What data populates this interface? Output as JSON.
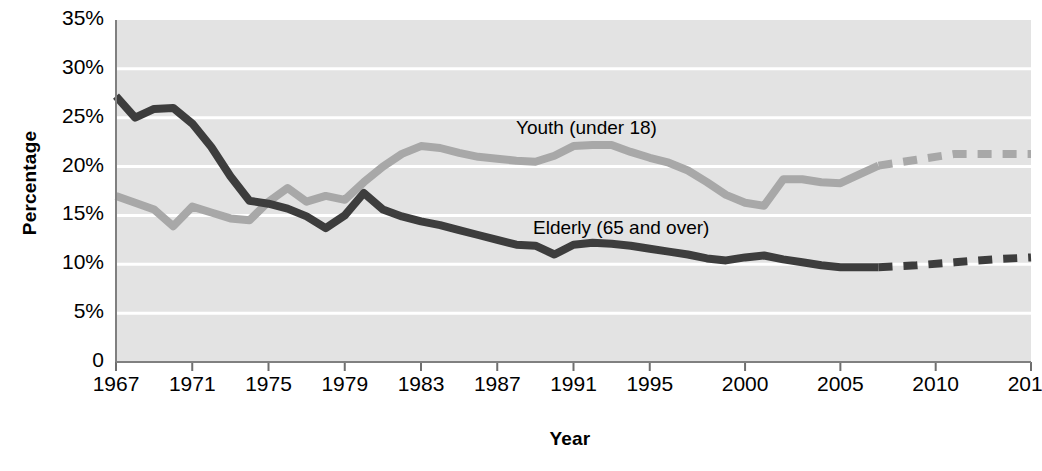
{
  "chart_data": {
    "type": "line",
    "title": "",
    "xlabel": "Year",
    "ylabel": "Percentage",
    "ylim": [
      0,
      35
    ],
    "xlim": [
      1967,
      2015
    ],
    "grid": true,
    "legend_position": "inline-annotation",
    "y_tick_labels": [
      "35%",
      "30%",
      "25%",
      "20%",
      "15%",
      "10%",
      "5%",
      "0"
    ],
    "y_tick_values": [
      35,
      30,
      25,
      20,
      15,
      10,
      5,
      0
    ],
    "x_tick_labels": [
      "1967",
      "1971",
      "1975",
      "1979",
      "1983",
      "1987",
      "1991",
      "1995",
      "2000",
      "2005",
      "2010",
      "2015"
    ],
    "x_tick_values": [
      1967,
      1971,
      1975,
      1979,
      1983,
      1987,
      1991,
      1995,
      2000,
      2005,
      2010,
      2015
    ],
    "projection_starts_year": 2007,
    "series": [
      {
        "name": "Youth (under 18)",
        "color": "#a8a8a8",
        "x": [
          1967,
          1968,
          1969,
          1970,
          1971,
          1972,
          1973,
          1974,
          1975,
          1976,
          1977,
          1978,
          1979,
          1980,
          1981,
          1982,
          1983,
          1984,
          1985,
          1986,
          1987,
          1988,
          1989,
          1990,
          1991,
          1992,
          1993,
          1994,
          1995,
          1996,
          1997,
          1998,
          1999,
          2000,
          2001,
          2002,
          2003,
          2004,
          2005,
          2006,
          2007,
          2009,
          2011,
          2013,
          2015
        ],
        "values": [
          17.0,
          16.3,
          15.6,
          13.9,
          15.9,
          15.3,
          14.7,
          14.5,
          16.4,
          17.8,
          16.4,
          17.0,
          16.6,
          18.4,
          20.0,
          21.3,
          22.1,
          21.9,
          21.4,
          21.0,
          20.8,
          20.6,
          20.5,
          21.1,
          22.1,
          22.2,
          22.2,
          21.5,
          20.9,
          20.4,
          19.6,
          18.4,
          17.1,
          16.3,
          16.0,
          18.7,
          18.7,
          18.4,
          18.3,
          19.2,
          20.1,
          20.7,
          21.3,
          21.3,
          21.3
        ],
        "style_note": "solid until 2007, dashed projection 2007 to 2015"
      },
      {
        "name": "Elderly (65 and over)",
        "color": "#3d3d3d",
        "x": [
          1967,
          1968,
          1969,
          1970,
          1971,
          1972,
          1973,
          1974,
          1975,
          1976,
          1977,
          1978,
          1979,
          1980,
          1981,
          1982,
          1983,
          1984,
          1985,
          1986,
          1987,
          1988,
          1989,
          1990,
          1991,
          1992,
          1993,
          1994,
          1995,
          1996,
          1997,
          1998,
          1999,
          2000,
          2001,
          2002,
          2003,
          2004,
          2005,
          2006,
          2007,
          2009,
          2011,
          2013,
          2015
        ],
        "values": [
          27.2,
          25.0,
          25.9,
          26.0,
          24.4,
          22.0,
          19.0,
          16.5,
          16.2,
          15.7,
          14.9,
          13.7,
          15.0,
          17.3,
          15.6,
          14.9,
          14.4,
          14.0,
          13.5,
          13.0,
          12.5,
          12.0,
          11.9,
          11.0,
          12.0,
          12.2,
          12.1,
          11.9,
          11.6,
          11.3,
          11.0,
          10.6,
          10.4,
          10.7,
          10.9,
          10.5,
          10.2,
          9.9,
          9.7,
          9.7,
          9.7,
          9.9,
          10.2,
          10.5,
          10.7
        ],
        "style_note": "solid until 2007, dashed projection 2007 to 2015"
      }
    ],
    "annotations": [
      {
        "text": "Youth (under 18)",
        "series": "Youth (under 18)"
      },
      {
        "text": "Elderly (65 and over)",
        "series": "Elderly (65 and over)"
      }
    ]
  },
  "plot": {
    "background": "#e3e3e3",
    "gridline_color": "#ffffff",
    "axis_color": "#808080"
  }
}
